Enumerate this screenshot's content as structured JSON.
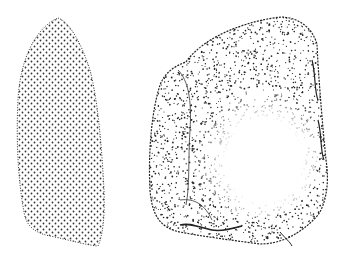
{
  "figure": {
    "background": "#ffffff",
    "ink_color": "#222222",
    "objects": [
      {
        "name": "left-tool",
        "style": "regular dot grid, dotted outline",
        "shape": "elongated leaf / bullet shape, pointed top, flat slanted base"
      },
      {
        "name": "right-tool",
        "style": "dense random stipple at edges, blank center",
        "shape": "rounded irregular trapezoid with flaked lower edge"
      }
    ]
  }
}
